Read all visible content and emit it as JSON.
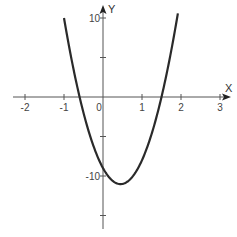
{
  "chart_data": {
    "type": "line",
    "title": "",
    "xlabel": "X",
    "ylabel": "Y",
    "xlim": [
      -2.25,
      3.3
    ],
    "ylim": [
      -16.5,
      11.5
    ],
    "grid": false,
    "legend": null,
    "x_ticks": [
      -2,
      -1,
      0,
      1,
      2,
      3
    ],
    "x_tick_labels": [
      "-2",
      "-1",
      "0",
      "1",
      "2",
      "3"
    ],
    "y_ticks": [
      10,
      5,
      -5,
      -10,
      -15
    ],
    "y_tick_labels": [
      "10",
      "",
      "",
      "-10",
      ""
    ],
    "origin_label": "0",
    "series": [
      {
        "name": "f(x) = 10x² − 9x − 9",
        "expression": "10*x^2 - 9*x - 9",
        "x": [
          -1.0,
          -0.8,
          -0.6,
          -0.4,
          -0.2,
          0.0,
          0.2,
          0.45,
          0.6,
          0.8,
          1.0,
          1.2,
          1.5,
          1.7,
          1.92
        ],
        "y": [
          10.0,
          4.6,
          0.0,
          -3.8,
          -6.8,
          -9.0,
          -10.4,
          -11.0,
          -10.8,
          -9.8,
          -8.0,
          -5.4,
          0.0,
          4.6,
          10.6
        ],
        "color": "#2a2a2a"
      }
    ],
    "annotations": {
      "roots": [
        -0.6,
        1.5
      ],
      "vertex": [
        0.45,
        -11.0
      ],
      "y_intercept": -9
    }
  },
  "colors": {
    "axis": "#555555",
    "curve": "#2a2a2a",
    "text": "#444444",
    "background": "#ffffff"
  }
}
